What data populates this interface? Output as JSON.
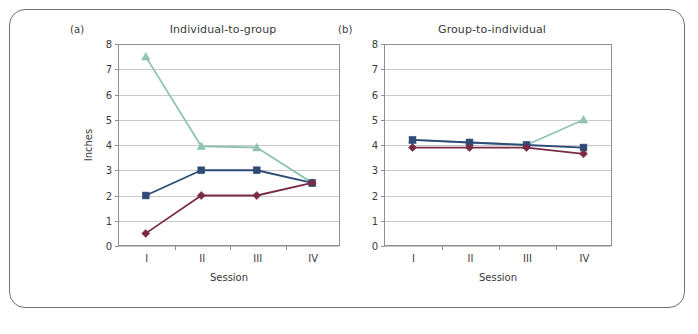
{
  "figure": {
    "background": "#ffffff",
    "border_color": "#7d6b7d"
  },
  "chart_data": [
    {
      "type": "line",
      "panel_letter": "(a)",
      "title": "Individual-to-group",
      "xlabel": "Session",
      "ylabel": "Inches",
      "categories": [
        "I",
        "II",
        "III",
        "IV"
      ],
      "ylim": [
        0,
        8
      ],
      "yticks": [
        0,
        1,
        2,
        3,
        4,
        5,
        6,
        7,
        8
      ],
      "grid": true,
      "legend": "none",
      "series": [
        {
          "name": "series-green-triangle",
          "marker": "triangle",
          "color": "#8fc4b0",
          "values": [
            7.5,
            3.95,
            3.9,
            2.5
          ]
        },
        {
          "name": "series-blue-square",
          "marker": "square",
          "color": "#2e4a77",
          "values": [
            2.0,
            3.0,
            3.0,
            2.5
          ]
        },
        {
          "name": "series-maroon-diamond",
          "marker": "diamond",
          "color": "#7b2a46",
          "values": [
            0.5,
            2.0,
            2.0,
            2.5
          ]
        }
      ]
    },
    {
      "type": "line",
      "panel_letter": "(b)",
      "title": "Group-to-individual",
      "xlabel": "Session",
      "ylabel": "",
      "categories": [
        "I",
        "II",
        "III",
        "IV"
      ],
      "ylim": [
        0,
        8
      ],
      "yticks": [
        0,
        1,
        2,
        3,
        4,
        5,
        6,
        7,
        8
      ],
      "grid": true,
      "legend": "none",
      "series": [
        {
          "name": "series-green-triangle",
          "marker": "triangle",
          "color": "#8fc4b0",
          "values": [
            4.2,
            4.1,
            4.0,
            5.0
          ]
        },
        {
          "name": "series-blue-square",
          "marker": "square",
          "color": "#2e4a77",
          "values": [
            4.2,
            4.1,
            4.0,
            3.9
          ]
        },
        {
          "name": "series-maroon-diamond",
          "marker": "diamond",
          "color": "#7b2a46",
          "values": [
            3.9,
            3.9,
            3.9,
            3.65
          ]
        }
      ]
    }
  ]
}
